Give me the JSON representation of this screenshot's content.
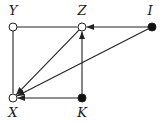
{
  "diagram": {
    "nodes": [
      {
        "id": "Y",
        "label": "Y",
        "style": "open"
      },
      {
        "id": "Z",
        "label": "Z",
        "style": "open"
      },
      {
        "id": "I",
        "label": "I",
        "style": "filled"
      },
      {
        "id": "X",
        "label": "X",
        "style": "open"
      },
      {
        "id": "K",
        "label": "K",
        "style": "filled"
      }
    ],
    "edges": [
      {
        "from": "Y",
        "to": "Z",
        "directed": false
      },
      {
        "from": "Y",
        "to": "X",
        "directed": false
      },
      {
        "from": "I",
        "to": "Z",
        "directed": true
      },
      {
        "from": "K",
        "to": "Z",
        "directed": true
      },
      {
        "from": "Z",
        "to": "X",
        "directed": true
      },
      {
        "from": "I",
        "to": "X",
        "directed": true
      },
      {
        "from": "K",
        "to": "X",
        "directed": true
      }
    ]
  }
}
